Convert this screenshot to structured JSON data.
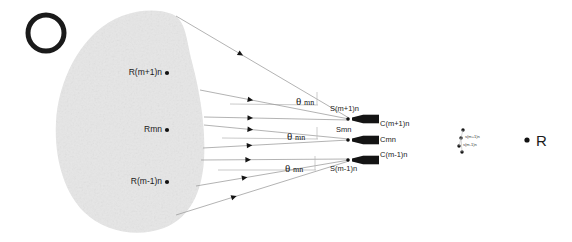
{
  "figure": {
    "background_color": "#ffffff",
    "blob_fill": "#e6e6e6",
    "ink_color": "#1a1a1a",
    "ray_color": "#9a9a9a"
  },
  "source_marker": {
    "name": "open-circle-source",
    "cx": 46,
    "cy": 33,
    "r": 18,
    "stroke_width": 5
  },
  "tissue_blob": {
    "label": "scattering-medium",
    "path": "M 172 14 C 150 6, 118 12, 96 32 C 74 52, 58 86, 56 122 C 54 158, 64 192, 84 212 C 104 232, 138 238, 164 228 C 190 218, 202 192, 204 160 C 206 128, 200 92, 192 62 C 186 38, 186 20, 172 14 Z"
  },
  "scatter_points": [
    {
      "id": "Rm1n_plus",
      "label": "R(m+1)n",
      "x": 167,
      "y": 73,
      "label_anchor": "end"
    },
    {
      "id": "Rmn",
      "label": "Rmn",
      "x": 167,
      "y": 130,
      "label_anchor": "end"
    },
    {
      "id": "Rm1n_minus",
      "label": "R(m-1)n",
      "x": 167,
      "y": 182,
      "label_anchor": "end"
    }
  ],
  "detectors": [
    {
      "id": "det_plus",
      "source_label": "S(m+1)n",
      "crystal_label": "C(m+1)n",
      "x": 352,
      "y": 119
    },
    {
      "id": "det_mid",
      "source_label": "Smn",
      "crystal_label": "Cmn",
      "x": 352,
      "y": 140
    },
    {
      "id": "det_minus",
      "source_label": "S(m-1)n",
      "crystal_label": "C(m-1)n",
      "x": 352,
      "y": 160
    }
  ],
  "angle_labels": [
    {
      "id": "theta_top",
      "symbol": "θ",
      "subscript": "mn",
      "x": 296,
      "y": 96
    },
    {
      "id": "theta_mid",
      "symbol": "θ",
      "subscript": "mn",
      "x": 287,
      "y": 131
    },
    {
      "id": "theta_bot",
      "symbol": "θ",
      "subscript": "mn",
      "x": 285,
      "y": 163
    }
  ],
  "rays": [
    {
      "id": "ray-1",
      "x1": 176,
      "y1": 16,
      "x2": 349,
      "y2": 118,
      "arrow_t": 0.36
    },
    {
      "id": "ray-2",
      "x1": 200,
      "y1": 90,
      "x2": 349,
      "y2": 119,
      "arrow_t": 0.32
    },
    {
      "id": "ray-3",
      "x1": 204,
      "y1": 117,
      "x2": 349,
      "y2": 120,
      "arrow_t": 0.3
    },
    {
      "id": "ray-4",
      "x1": 204,
      "y1": 125,
      "x2": 349,
      "y2": 139,
      "arrow_t": 0.3
    },
    {
      "id": "ray-5",
      "x1": 203,
      "y1": 148,
      "x2": 349,
      "y2": 140,
      "arrow_t": 0.3
    },
    {
      "id": "ray-6",
      "x1": 201,
      "y1": 160,
      "x2": 349,
      "y2": 159,
      "arrow_t": 0.3
    },
    {
      "id": "ray-7",
      "x1": 196,
      "y1": 186,
      "x2": 349,
      "y2": 160,
      "arrow_t": 0.3
    },
    {
      "id": "ray-8",
      "x1": 176,
      "y1": 215,
      "x2": 349,
      "y2": 161,
      "arrow_t": 0.32
    }
  ],
  "angle_guides": [
    {
      "id": "guide_top",
      "x1": 230,
      "y1": 104,
      "x2": 318,
      "y2": 105
    },
    {
      "id": "guide_mid",
      "x1": 222,
      "y1": 138,
      "x2": 318,
      "y2": 139
    },
    {
      "id": "guide_bot",
      "x1": 218,
      "y1": 170,
      "x2": 316,
      "y2": 170
    }
  ],
  "angle_ticks": [
    {
      "id": "tick_top",
      "x": 317,
      "y1": 92,
      "y2": 105
    },
    {
      "id": "tick_mid",
      "x": 317,
      "y1": 127,
      "y2": 139
    },
    {
      "id": "tick_bot",
      "x": 315,
      "y1": 156,
      "y2": 170
    }
  ],
  "far_cluster": {
    "label": "detector-cluster-far",
    "points": [
      {
        "x": 463,
        "y": 130,
        "text": ""
      },
      {
        "x": 461,
        "y": 138,
        "text": "s(m+1)n"
      },
      {
        "x": 459,
        "y": 146,
        "text": "s(m-1)n"
      },
      {
        "x": 462,
        "y": 152,
        "text": ""
      }
    ]
  },
  "reference_point": {
    "label": "R",
    "dot_x": 527,
    "dot_y": 140,
    "text_x": 536,
    "text_y": 133
  }
}
